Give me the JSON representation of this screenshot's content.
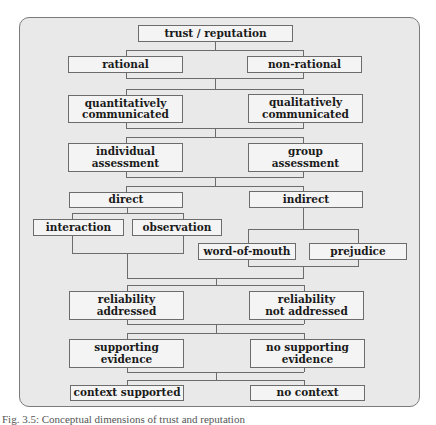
{
  "diagram": {
    "root": "trust / reputation",
    "levels": [
      {
        "left": "rational",
        "right": "non-rational"
      },
      {
        "left": "quantitatively\ncommunicated",
        "right": "qualitatively\ncommunicated"
      },
      {
        "left": "individual\nassessment",
        "right": "group\nassessment"
      },
      {
        "left": "direct",
        "right": "indirect",
        "left_children": [
          "interaction",
          "observation"
        ],
        "right_children": [
          "word-of-mouth",
          "prejudice"
        ]
      },
      {
        "left": "reliability\naddressed",
        "right": "reliability\nnot addressed"
      },
      {
        "left": "supporting\nevidence",
        "right": "no supporting\nevidence"
      },
      {
        "left": "context supported",
        "right": "no context"
      }
    ]
  },
  "caption": "Fig. 3.5: Conceptual dimensions of trust and reputation",
  "colors": {
    "frame_fill": "#e9e9e9",
    "box_fill": "#f4f4f4",
    "line": "#6c6c6c"
  }
}
